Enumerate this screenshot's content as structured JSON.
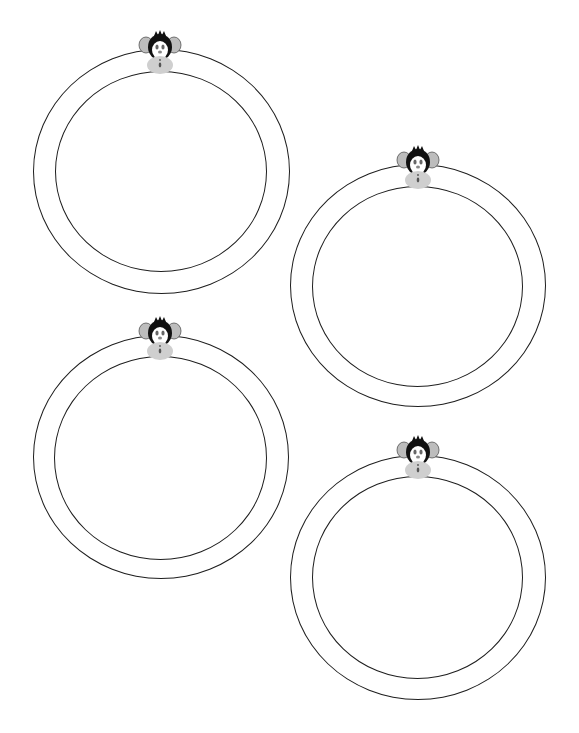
{
  "canvas": {
    "width": 579,
    "height": 733,
    "background": "#ffffff"
  },
  "rings": [
    {
      "id": 1,
      "outer": {
        "left": 33,
        "top": 49,
        "width": 257,
        "height": 245
      },
      "inner": {
        "left": 55,
        "top": 71,
        "width": 212,
        "height": 201
      },
      "monkey": {
        "icon": "monkey-face-icon",
        "left": 137,
        "top": 30
      }
    },
    {
      "id": 2,
      "outer": {
        "left": 290,
        "top": 164,
        "width": 256,
        "height": 243
      },
      "inner": {
        "left": 312,
        "top": 186,
        "width": 211,
        "height": 201
      },
      "monkey": {
        "icon": "monkey-face-icon",
        "left": 395,
        "top": 145
      }
    },
    {
      "id": 3,
      "outer": {
        "left": 33,
        "top": 335,
        "width": 256,
        "height": 244
      },
      "inner": {
        "left": 54,
        "top": 356,
        "width": 213,
        "height": 204
      },
      "monkey": {
        "icon": "monkey-face-icon",
        "left": 137,
        "top": 316
      }
    },
    {
      "id": 4,
      "outer": {
        "left": 290,
        "top": 455,
        "width": 256,
        "height": 245
      },
      "inner": {
        "left": 312,
        "top": 476,
        "width": 211,
        "height": 203
      },
      "monkey": {
        "icon": "monkey-face-icon",
        "left": 395,
        "top": 435
      }
    }
  ],
  "colors": {
    "line": "#1e1e1e",
    "monkey_fur": "#111111",
    "monkey_ear": "#bdbdbd",
    "monkey_face": "#ffffff",
    "monkey_muzzle": "#cfcfcf",
    "monkey_eye": "#666666"
  }
}
